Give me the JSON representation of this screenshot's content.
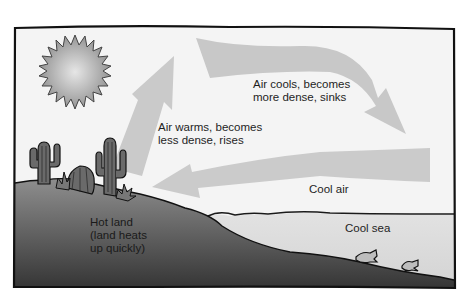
{
  "diagram": {
    "colors": {
      "frame": "#111111",
      "sky": "#f3f3f3",
      "arrow": "#c9c9c9",
      "land_top": "#8a8a8a",
      "land_bottom": "#3a3a3a",
      "sea": "#dedede",
      "sun_center": "#e4e4e4",
      "sun_edge": "#8e8e8e"
    },
    "labels": {
      "air_warms": "Air warms, becomes\nless dense, rises",
      "air_cools": "Air cools, becomes\nmore dense, sinks",
      "cool_air": "Cool air",
      "hot_land": "Hot land\n(land heats\nup quickly)",
      "cool_sea": "Cool sea"
    },
    "icons": [
      "sun-icon",
      "cactus-icon",
      "barrel-cactus-icon",
      "shrub-icon",
      "fish-icon"
    ],
    "arrows": [
      {
        "name": "rising-air-arrow",
        "direction": "up"
      },
      {
        "name": "sinking-air-arrow",
        "direction": "right-down"
      },
      {
        "name": "cool-air-arrow",
        "direction": "left"
      }
    ]
  }
}
